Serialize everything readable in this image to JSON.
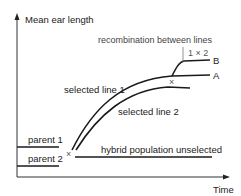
{
  "diagram": {
    "axes": {
      "y_label": "Mean ear length",
      "x_label": "Time"
    },
    "labels": {
      "recombination": "recombination between lines",
      "cross_1x2": "1 × 2",
      "line_b": "B",
      "line_a": "A",
      "selected_line_1": "selected line 1",
      "selected_line_2": "selected line 2",
      "parent_1": "parent 1",
      "parent_2": "parent 2",
      "hybrid": "hybrid population unselected",
      "cross_mark": "×",
      "cross_mark_2": "×"
    },
    "colors": {
      "line": "#1a1a1a",
      "axis": "#333333",
      "thin": "#777777"
    }
  }
}
